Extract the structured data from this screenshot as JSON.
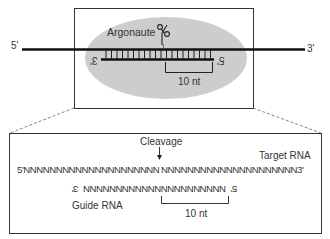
{
  "upper_panel": {
    "protein_label": "Argonaute",
    "target_5prime": "5'",
    "target_3prime": "3'",
    "guide_3prime_mirrored": "3'",
    "guide_5prime_mirrored": "5'",
    "bracket_label": "10 nt",
    "scissors_icon": "scissors",
    "ellipse_color": "#cfcfcf"
  },
  "lower_panel": {
    "cleavage_label": "Cleavage",
    "target_label": "Target RNA",
    "target_sequence_left": "5'NNNNNNNNNNNNNNNNNNNNN",
    "target_sequence_right": "NNNNNNNNNNNNNNNNNNNNN3'",
    "guide_end_left_mirrored": "3'",
    "guide_sequence": "NNNNNNNNNNNNNNNNNNNNNN",
    "guide_end_right_mirrored": "5'",
    "guide_label": "Guide RNA",
    "bracket_label": "10 nt"
  }
}
